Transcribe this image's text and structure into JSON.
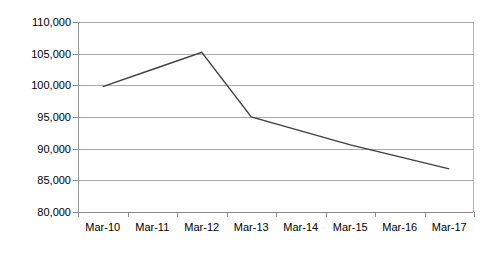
{
  "chart_data": {
    "type": "line",
    "title": "",
    "xlabel": "",
    "ylabel": "",
    "categories": [
      "Mar-10",
      "Mar-11",
      "Mar-12",
      "Mar-13",
      "Mar-14",
      "Mar-15",
      "Mar-16",
      "Mar-17"
    ],
    "series": [
      {
        "name": "Series 1",
        "values": [
          99800,
          102500,
          105200,
          95000,
          92800,
          90600,
          88700,
          86800
        ],
        "color": "#3f3f3f"
      }
    ],
    "ylim": [
      80000,
      110000
    ],
    "yticks": [
      80000,
      85000,
      90000,
      95000,
      100000,
      105000,
      110000
    ],
    "ytick_labels": [
      "80,000",
      "85,000",
      "90,000",
      "95,000",
      "100,000",
      "105,000",
      "110,000"
    ],
    "grid": true,
    "grid_axis": "y",
    "legend": "none",
    "gridline_color": "#a8a8a8",
    "axis_color": "#8a8a8a",
    "background": "#ffffff"
  }
}
